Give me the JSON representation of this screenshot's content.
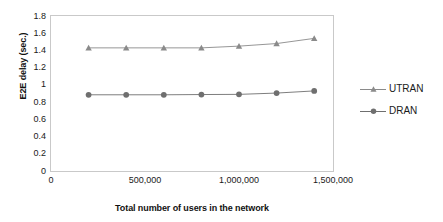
{
  "chart_data": {
    "type": "line",
    "title": "",
    "xlabel": "Total number of users in the network",
    "ylabel": "E2E delay (sec.)",
    "xlim": [
      0,
      1500000
    ],
    "ylim": [
      0,
      1.8
    ],
    "grid": false,
    "legend_position": "right",
    "xticks": [
      "0",
      "500,000",
      "1,000,000",
      "1,500,000"
    ],
    "xtick_values": [
      0,
      500000,
      1000000,
      1500000
    ],
    "yticks": [
      "1.8",
      "1.6",
      "1.4",
      "1.2",
      "1",
      "0.8",
      "0.6",
      "0.4",
      "0.2",
      "0"
    ],
    "ytick_values": [
      1.8,
      1.6,
      1.4,
      1.2,
      1,
      0.8,
      0.6,
      0.4,
      0.2,
      0
    ],
    "x": [
      200000,
      400000,
      600000,
      800000,
      1000000,
      1200000,
      1400000
    ],
    "series": [
      {
        "name": "UTRAN",
        "marker": "triangle",
        "color": "#8a8a8a",
        "values": [
          1.43,
          1.43,
          1.43,
          1.43,
          1.45,
          1.48,
          1.54
        ]
      },
      {
        "name": "DRAN",
        "marker": "circle",
        "color": "#6f6f6f",
        "values": [
          0.885,
          0.885,
          0.885,
          0.888,
          0.89,
          0.905,
          0.93
        ]
      }
    ]
  },
  "legend": {
    "items": [
      {
        "label": "UTRAN"
      },
      {
        "label": "DRAN"
      }
    ]
  },
  "colors": {
    "axis": "#c9c9c9",
    "text": "#1a1a1a",
    "utran": "#8a8a8a",
    "dran": "#6f6f6f"
  }
}
